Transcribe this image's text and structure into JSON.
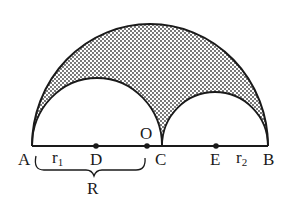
{
  "diagram": {
    "type": "arbelos",
    "colors": {
      "stroke": "#1a1a1a",
      "shade_dot": "#3a3a3a",
      "background": "#ffffff"
    },
    "points": {
      "A": {
        "label": "A"
      },
      "D": {
        "label": "D"
      },
      "O": {
        "label": "O"
      },
      "C": {
        "label": "C"
      },
      "E": {
        "label": "E"
      },
      "B": {
        "label": "B"
      }
    },
    "radii": {
      "r1": {
        "symbol": "r",
        "subscript": "1"
      },
      "r2": {
        "symbol": "r",
        "subscript": "2"
      },
      "R": {
        "label": "R"
      }
    },
    "shading": "dotted pattern in region between large semicircle and two small semicircles"
  }
}
